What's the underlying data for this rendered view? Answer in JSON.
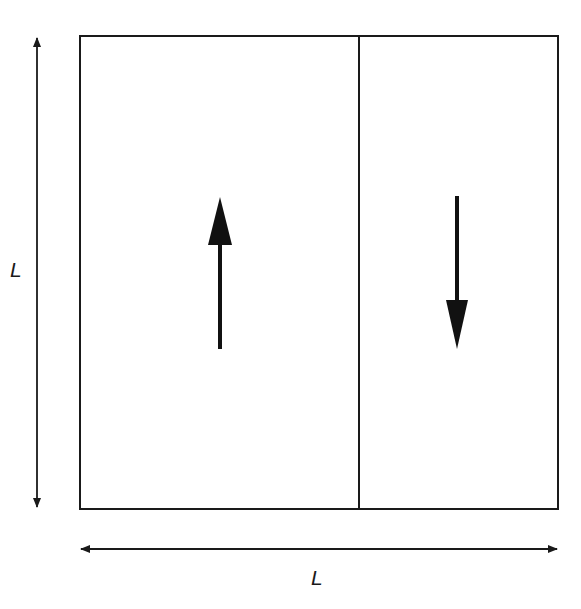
{
  "diagram": {
    "type": "square domain split into two regions with opposing flow",
    "colors": {
      "stroke": "#1a1a1a",
      "background": "#ffffff"
    },
    "outer_box": {
      "x": 80,
      "y": 36,
      "width": 478,
      "height": 473
    },
    "divider_x": 359,
    "left_region": {
      "arrow_direction": "up",
      "arrow_icon": "arrow-up"
    },
    "right_region": {
      "arrow_direction": "down",
      "arrow_icon": "arrow-down"
    },
    "vertical_dimension": {
      "label": "L"
    },
    "horizontal_dimension": {
      "label": "L"
    }
  }
}
